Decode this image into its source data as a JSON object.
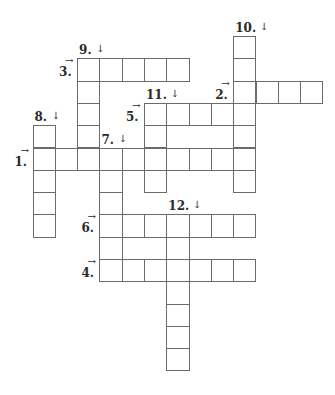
{
  "puzzle": {
    "type": "crossword",
    "cell_size": 22.3,
    "origin": {
      "x": 32.5,
      "y": 36
    },
    "colors": {
      "border": "#6b6b6b",
      "cell": "#ffffff",
      "text": "#2a2a2a"
    },
    "entries": [
      {
        "number": "1",
        "direction": "across",
        "row": 5,
        "col": 0,
        "length": 10,
        "label": "1.",
        "arrow": "→"
      },
      {
        "number": "2",
        "direction": "across",
        "row": 2,
        "col": 9,
        "length": 4,
        "label": "2.",
        "arrow": "→"
      },
      {
        "number": "3",
        "direction": "across",
        "row": 1,
        "col": 2,
        "length": 5,
        "label": "3.",
        "arrow": "→"
      },
      {
        "number": "4",
        "direction": "across",
        "row": 10,
        "col": 3,
        "length": 7,
        "label": "4.",
        "arrow": "→"
      },
      {
        "number": "5",
        "direction": "across",
        "row": 3,
        "col": 5,
        "length": 5,
        "label": "5.",
        "arrow": "→"
      },
      {
        "number": "6",
        "direction": "across",
        "row": 8,
        "col": 3,
        "length": 7,
        "label": "6.",
        "arrow": "→"
      },
      {
        "number": "7",
        "direction": "down",
        "row": 5,
        "col": 3,
        "length": 6,
        "label": "7.",
        "arrow": "↓"
      },
      {
        "number": "8",
        "direction": "down",
        "row": 4,
        "col": 0,
        "length": 5,
        "label": "8.",
        "arrow": "↓"
      },
      {
        "number": "9",
        "direction": "down",
        "row": 1,
        "col": 2,
        "length": 5,
        "label": "9.",
        "arrow": "↓"
      },
      {
        "number": "10",
        "direction": "down",
        "row": 0,
        "col": 9,
        "length": 7,
        "label": "10.",
        "arrow": "↓"
      },
      {
        "number": "11",
        "direction": "down",
        "row": 3,
        "col": 5,
        "length": 4,
        "label": "11.",
        "arrow": "↓"
      },
      {
        "number": "12",
        "direction": "down",
        "row": 8,
        "col": 6,
        "length": 7,
        "label": "12.",
        "arrow": "↓"
      }
    ]
  }
}
